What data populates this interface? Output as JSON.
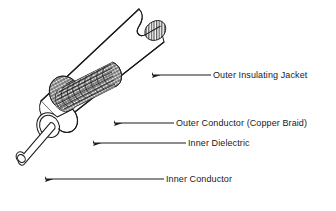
{
  "figure": {
    "type": "technical-illustration",
    "background_color": "#ffffff",
    "line_color": "#1a1a1a",
    "fill_color": "#ffffff"
  },
  "labels": [
    {
      "id": "outer-insulating-jacket",
      "text": "Outer Insulating Jacket",
      "text_x": 213,
      "text_y": 75,
      "leader_start_x": 211,
      "leader_end_x": 152,
      "leader_y": 75,
      "arrow_direction": "left"
    },
    {
      "id": "outer-conductor-copper-braid",
      "text": "Outer Conductor (Copper Braid)",
      "text_x": 176,
      "text_y": 123,
      "leader_start_x": 174,
      "leader_end_x": 114,
      "leader_y": 123,
      "arrow_direction": "left"
    },
    {
      "id": "inner-dielectric",
      "text": "Inner Dielectric",
      "text_x": 188,
      "text_y": 143,
      "leader_start_x": 186,
      "leader_end_x": 93,
      "leader_y": 143,
      "arrow_direction": "left"
    },
    {
      "id": "inner-conductor",
      "text": "Inner Conductor",
      "text_x": 166,
      "text_y": 179,
      "leader_start_x": 164,
      "leader_end_x": 45,
      "leader_y": 179,
      "arrow_direction": "left"
    }
  ],
  "parts": [
    {
      "id": "outer-insulating-jacket",
      "name": "Outer Insulating Jacket",
      "render": "outer-tube-cutaway"
    },
    {
      "id": "outer-conductor-copper-braid",
      "name": "Outer Conductor (Copper Braid)",
      "render": "woven-braid-mesh"
    },
    {
      "id": "inner-dielectric",
      "name": "Inner Dielectric",
      "render": "white-cylinder"
    },
    {
      "id": "inner-conductor",
      "name": "Inner Conductor",
      "render": "thin-rod"
    }
  ]
}
